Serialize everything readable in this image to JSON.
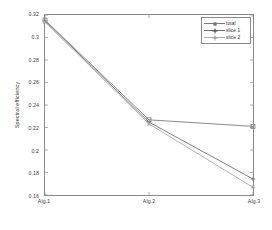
{
  "chart_data": {
    "type": "line",
    "title": "",
    "subtitle": "",
    "xlabel": "",
    "ylabel": "Spectral efficiency",
    "categories": [
      "Alg.1",
      "Alg.2",
      "Alg.3"
    ],
    "x": [
      1,
      2,
      3
    ],
    "xlim": [
      1,
      3
    ],
    "ylim": [
      0.16,
      0.32
    ],
    "yticks": [
      0.16,
      0.18,
      0.2,
      0.22,
      0.24,
      0.26,
      0.28,
      0.3,
      0.32
    ],
    "ytick_labels": [
      "0.16",
      "0.18",
      "0.2",
      "0.22",
      "0.24",
      "0.26",
      "0.28",
      "0.3",
      "0.32"
    ],
    "grid": false,
    "legend_position": "top-right",
    "series": [
      {
        "name": "total",
        "values": [
          0.3155,
          0.2268,
          0.221
        ],
        "marker": "square",
        "color": "#7a7a7a"
      },
      {
        "name": "slice 1",
        "values": [
          0.3148,
          0.2248,
          0.1742
        ],
        "marker": "plus",
        "color": "#6e6e6e"
      },
      {
        "name": "slice 2",
        "values": [
          0.3138,
          0.2232,
          0.1668
        ],
        "marker": "star",
        "color": "#a8a8a8"
      }
    ]
  },
  "legend": {
    "entries": [
      "total",
      "slice 1",
      "slice 2"
    ]
  },
  "axis": {
    "y_title": "Spectral efficiency",
    "x_tick_labels": [
      "Alg.1",
      "Alg.2",
      "Alg.3"
    ],
    "y_tick_labels": [
      "0.32",
      "0.3",
      "0.28",
      "0.26",
      "0.24",
      "0.22",
      "0.2",
      "0.18",
      "0.16"
    ]
  },
  "colors": {
    "frame": "#8a8a8a",
    "text": "#3a3a3a",
    "background": "#ffffff"
  }
}
